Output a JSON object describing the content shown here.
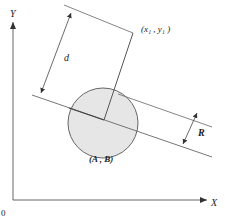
{
  "diagram": {
    "type": "geometry",
    "axes": {
      "x_label": "X",
      "y_label": "Y",
      "origin_label": "0"
    },
    "labels": {
      "point_far": "(x₁ , y₁ )",
      "center": "(A , B)",
      "distance": "d",
      "radius": "R"
    },
    "colors": {
      "line": "#555555",
      "circle_fill": "#e6e6e6",
      "circle_stroke": "#555555",
      "text": "#222222"
    }
  }
}
